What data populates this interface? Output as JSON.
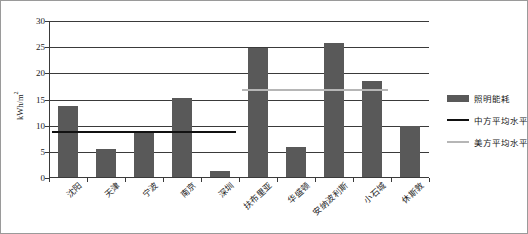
{
  "chart_data": {
    "type": "bar",
    "title": "",
    "xlabel": "",
    "ylabel": "kWh/m2",
    "ylabel_base": "kWh/m",
    "ylabel_sup": "2",
    "ylim": [
      0,
      30
    ],
    "ytick_values": [
      0,
      5,
      10,
      15,
      20,
      25,
      30
    ],
    "ytick_labels": [
      "0",
      "5",
      "10",
      "15",
      "20",
      "25",
      "30"
    ],
    "grid": true,
    "legend_position": "right",
    "categories": [
      "沈阳",
      "天津",
      "宁波",
      "南京",
      "深圳",
      "扶布里亚",
      "华盛顿",
      "安纳波利斯",
      "小石城",
      "休斯敦"
    ],
    "series": [
      {
        "name": "照明能耗",
        "type": "bar",
        "color": "#595959",
        "values": [
          13.6,
          5.4,
          8.4,
          15.1,
          1.2,
          24.6,
          5.7,
          25.7,
          18.4,
          9.7
        ]
      },
      {
        "name": "中方平均水平",
        "type": "reference-line",
        "color": "#111111",
        "value": 8.8,
        "spans_categories": [
          1,
          5
        ]
      },
      {
        "name": "美方平均水平",
        "type": "reference-line",
        "color": "#b6b6b6",
        "value": 16.9,
        "spans_categories": [
          6,
          9
        ]
      }
    ],
    "legend_entries": [
      {
        "label": "照明能耗",
        "marker": "bar-swatch",
        "color": "#595959"
      },
      {
        "label": "中方平均水平",
        "marker": "line-swatch",
        "color": "#111111"
      },
      {
        "label": "美方平均水平",
        "marker": "line-swatch",
        "color": "#b6b6b6"
      }
    ]
  }
}
